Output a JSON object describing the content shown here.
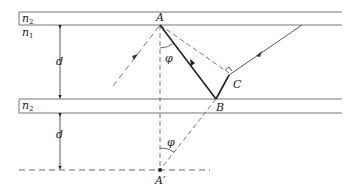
{
  "diagram": {
    "type": "optics-waveguide-geometry",
    "labels": {
      "n2_top": "n",
      "n2_top_sub": "2",
      "n1": "n",
      "n1_sub": "1",
      "n2_mid": "n",
      "n2_mid_sub": "2",
      "d_upper": "d",
      "d_lower": "d",
      "point_A": "A",
      "point_B": "B",
      "point_C": "C",
      "point_A_prime": "A′",
      "angle_upper": "φ",
      "angle_lower": "φ"
    },
    "colors": {
      "line": "#555555",
      "ray": "#222222",
      "text": "#222222"
    }
  }
}
